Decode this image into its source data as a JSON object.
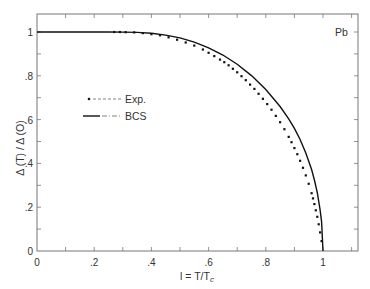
{
  "chart_data": {
    "type": "scatter",
    "title": "",
    "xlabel": "l = T/T",
    "xlabel_sub": "c",
    "ylabel": "Δ (T) / Δ (O)",
    "xlim": [
      0,
      1.12
    ],
    "ylim": [
      0,
      1.08
    ],
    "xticks": [
      0,
      0.2,
      0.4,
      0.6,
      0.8,
      1.0
    ],
    "xtick_labels": [
      "0",
      ".2",
      ".4",
      ".6",
      ".8",
      "1"
    ],
    "yticks": [
      0,
      0.2,
      0.4,
      0.6,
      0.8,
      1.0
    ],
    "ytick_labels": [
      "0",
      ".2",
      ".4",
      ".6",
      ".8",
      "1"
    ],
    "grid": false,
    "legend_position": "center-left",
    "annotation": "Pb",
    "series": [
      {
        "name": "Exp.",
        "kind": "points",
        "color": "#111111",
        "x": [
          0.27,
          0.29,
          0.31,
          0.34,
          0.37,
          0.4,
          0.43,
          0.46,
          0.49,
          0.52,
          0.55,
          0.58,
          0.6,
          0.62,
          0.64,
          0.655,
          0.67,
          0.685,
          0.7,
          0.715,
          0.73,
          0.745,
          0.76,
          0.775,
          0.79,
          0.805,
          0.82,
          0.835,
          0.85,
          0.865,
          0.88,
          0.89,
          0.9,
          0.91,
          0.92,
          0.93,
          0.94,
          0.95,
          0.96,
          0.965,
          0.97,
          0.975,
          0.98,
          0.985,
          0.99,
          0.995
        ],
        "y": [
          1.0,
          1.0,
          0.999,
          0.998,
          0.995,
          0.99,
          0.985,
          0.976,
          0.965,
          0.952,
          0.938,
          0.92,
          0.905,
          0.89,
          0.874,
          0.862,
          0.848,
          0.832,
          0.816,
          0.798,
          0.78,
          0.76,
          0.74,
          0.718,
          0.695,
          0.671,
          0.645,
          0.617,
          0.588,
          0.556,
          0.521,
          0.497,
          0.47,
          0.442,
          0.412,
          0.38,
          0.345,
          0.307,
          0.264,
          0.24,
          0.214,
          0.186,
          0.156,
          0.122,
          0.085,
          0.045
        ]
      },
      {
        "name": "BCS",
        "kind": "line",
        "color": "#111111",
        "x": [
          0,
          0.1,
          0.2,
          0.25,
          0.3,
          0.35,
          0.4,
          0.45,
          0.5,
          0.55,
          0.6,
          0.65,
          0.7,
          0.75,
          0.8,
          0.85,
          0.88,
          0.9,
          0.92,
          0.94,
          0.96,
          0.97,
          0.98,
          0.99,
          0.995,
          1.0
        ],
        "y": [
          1.0,
          1.0,
          1.0,
          1.0,
          0.9997,
          0.998,
          0.994,
          0.986,
          0.973,
          0.954,
          0.928,
          0.895,
          0.853,
          0.801,
          0.737,
          0.66,
          0.603,
          0.56,
          0.509,
          0.448,
          0.372,
          0.324,
          0.266,
          0.188,
          0.133,
          0.0
        ]
      }
    ]
  }
}
